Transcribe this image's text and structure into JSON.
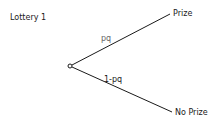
{
  "title": "Lottery 1",
  "nodes": {
    "top_outcome": "Prize",
    "bottom_outcome": "No Prize"
  },
  "branches": {
    "top_probability": "pq",
    "bottom_probability": "1-pq"
  }
}
